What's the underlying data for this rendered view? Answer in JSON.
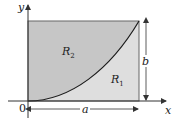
{
  "diagram": {
    "colors": {
      "region_r2": "#c6c6c6",
      "region_r1": "#dedede",
      "outline": "#555555",
      "curve": "#1a1a1a",
      "axis": "#333333",
      "text": "#222222"
    },
    "axes": {
      "x_label": "x",
      "y_label": "y",
      "origin_label": "0"
    },
    "regions": [
      {
        "id": "R2",
        "label": "R",
        "subscript": "2",
        "position": "upper-left, above curve"
      },
      {
        "id": "R1",
        "label": "R",
        "subscript": "1",
        "position": "lower-right, below curve"
      }
    ],
    "dimensions": {
      "width_label": "a",
      "height_label": "b"
    },
    "curve": {
      "description": "increasing convex curve from origin (0,0) to (a,b)"
    }
  }
}
